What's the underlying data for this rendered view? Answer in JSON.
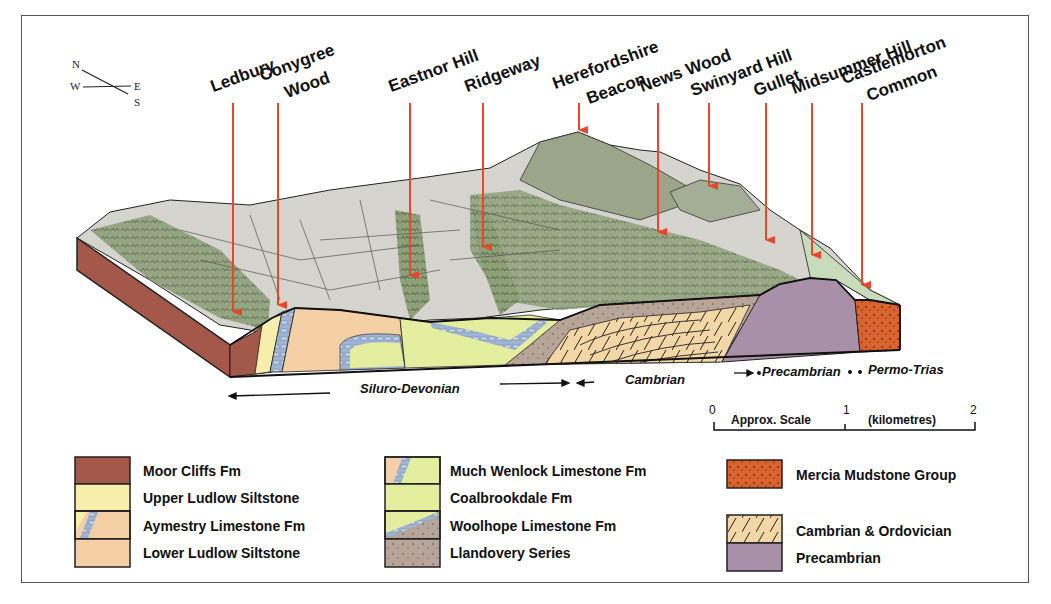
{
  "compass": {
    "n": "N",
    "e": "E",
    "s": "S",
    "w": "W"
  },
  "locations": [
    {
      "label": "Ledbury",
      "line2": ""
    },
    {
      "label": "Conygree",
      "line2": "Wood"
    },
    {
      "label": "Eastnor Hill",
      "line2": ""
    },
    {
      "label": "Ridgeway",
      "line2": ""
    },
    {
      "label": "Herefordshire",
      "line2": "Beacon"
    },
    {
      "label": "News Wood",
      "line2": ""
    },
    {
      "label": "Swinyard Hill",
      "line2": ""
    },
    {
      "label": "Gullet",
      "line2": ""
    },
    {
      "label": "Midsummer Hill",
      "line2": ""
    },
    {
      "label": "Castlemorton",
      "line2": "Common"
    }
  ],
  "eras": {
    "siluro_devonian": "Siluro-Devonian",
    "cambrian": "Cambrian",
    "precambrian": "Precambrian",
    "permo_trias": "Permo-Trias"
  },
  "scale": {
    "tick0": "0",
    "tick1": "1",
    "tick2": "2",
    "label": "Approx. Scale",
    "units": "(kilometres)"
  },
  "legend": {
    "col1": [
      {
        "label": "Moor Cliffs Fm",
        "color": "#a3584a"
      },
      {
        "label": "Upper Ludlow Siltstone",
        "color": "#f6eeaa"
      },
      {
        "label": "Aymestry Limestone Fm",
        "color": "#f5cfa6"
      },
      {
        "label": "Lower Ludlow Siltstone",
        "color": "#f5cfa6"
      }
    ],
    "col2": [
      {
        "label": "Much Wenlock Limestone Fm",
        "color": "#e3ef9e"
      },
      {
        "label": "Coalbrookdale Fm",
        "color": "#e3ef9e"
      },
      {
        "label": "Woolhope Limestone Fm",
        "color": "#b8a59a"
      },
      {
        "label": "Llandovery Series",
        "color": "#b8a59a"
      }
    ],
    "col3": [
      {
        "label": "Mercia Mudstone Group",
        "color": "#d9632e"
      },
      {
        "label": "Cambrian & Ordovician",
        "color": "#f4d7a6"
      },
      {
        "label": "Precambrian",
        "color": "#a890a8"
      }
    ]
  },
  "colors": {
    "arrow": "#e8472a",
    "moor_cliffs": "#a3584a",
    "limestone": "#9fb4d2",
    "precambrian": "#a890a8",
    "mercia": "#d9632e"
  }
}
